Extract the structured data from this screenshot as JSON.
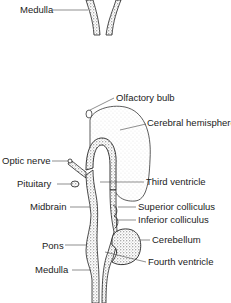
{
  "figure": {
    "top_panel": {
      "labels": [
        {
          "id": "medulla-top",
          "text": "Medulla"
        }
      ]
    },
    "main_panel": {
      "labels": [
        {
          "id": "olfactory-bulb",
          "text": "Olfactory bulb"
        },
        {
          "id": "cerebral-hemisphere",
          "text": "Cerebral hemisphere"
        },
        {
          "id": "optic-nerve",
          "text": "Optic nerve"
        },
        {
          "id": "pituitary",
          "text": "Pituitary"
        },
        {
          "id": "third-ventricle",
          "text": "Third ventricle"
        },
        {
          "id": "midbrain",
          "text": "Midbrain"
        },
        {
          "id": "superior-colliculus",
          "text": "Superior colliculus"
        },
        {
          "id": "inferior-colliculus",
          "text": "Inferior colliculus"
        },
        {
          "id": "cerebellum",
          "text": "Cerebellum"
        },
        {
          "id": "pons",
          "text": "Pons"
        },
        {
          "id": "fourth-ventricle",
          "text": "Fourth ventricle"
        },
        {
          "id": "medulla",
          "text": "Medulla"
        }
      ]
    },
    "colors": {
      "ink": "#222222",
      "stipple": "#555555",
      "background": "#ffffff"
    }
  }
}
